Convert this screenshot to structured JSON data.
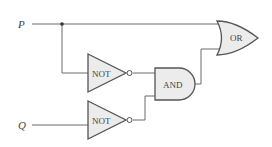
{
  "inputs": [
    {
      "name": "P"
    },
    {
      "name": "Q"
    }
  ],
  "gates": {
    "not1": {
      "label": "NOT"
    },
    "not2": {
      "label": "NOT"
    },
    "and": {
      "label": "AND"
    },
    "or": {
      "label": "OR"
    }
  },
  "colors": {
    "wire": "#6a6a6a",
    "gate_fill": "#ececec",
    "gate_stroke": "#555555"
  }
}
